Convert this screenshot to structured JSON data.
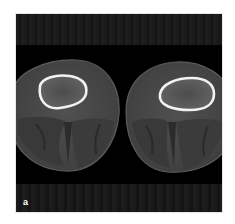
{
  "figure": {
    "panel_label": "a",
    "colors": {
      "background": "#000000",
      "soft_tissue": "#4a4a4a",
      "muscle": "#3d3d3d",
      "cortical_bone": "#f2f2f2",
      "marrow": "#5a5a5a",
      "page": "#ffffff"
    },
    "views": [
      {
        "side": "left-image",
        "structure": "leg cross-section"
      },
      {
        "side": "right-image",
        "structure": "leg cross-section"
      }
    ]
  }
}
